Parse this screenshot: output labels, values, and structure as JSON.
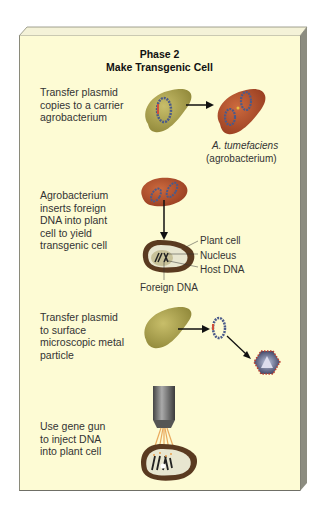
{
  "panel": {
    "title_line1": "Phase 2",
    "title_line2": "Make Transgenic Cell",
    "background": "#fdfbd4"
  },
  "steps": [
    {
      "text": "Transfer plasmid\ncopies to a carrier\nagrobacterium",
      "caption_species": "A. tumefaciens",
      "caption_common": "(agrobacterium)"
    },
    {
      "text": "Agrobacterium\ninserts foreign\nDNA into plant\ncell to yield\ntransgenic cell",
      "labels": [
        "Plant cell",
        "Nucleus",
        "Host DNA",
        "Foreign DNA"
      ]
    },
    {
      "text": "Transfer plasmid\nto surface\nmicroscopic metal\nparticle"
    },
    {
      "text": "Use gene gun\nto inject DNA\ninto plant cell"
    }
  ],
  "icons": [
    "bacterium-icon",
    "agrobacterium-icon",
    "plasmid-icon",
    "plant-cell-icon",
    "metal-particle-icon",
    "gene-gun-icon",
    "arrow-icon"
  ],
  "colors": {
    "bacterium_olive": "#b5ab55",
    "agrobacterium_red": "#b8522e",
    "plasmid_blue": "#4a5a8a",
    "plasmid_red": "#d0503a",
    "cell_wall": "#5a3a20",
    "gun_gray": "#6a6a6a",
    "beam_orange": "#e8a050"
  }
}
